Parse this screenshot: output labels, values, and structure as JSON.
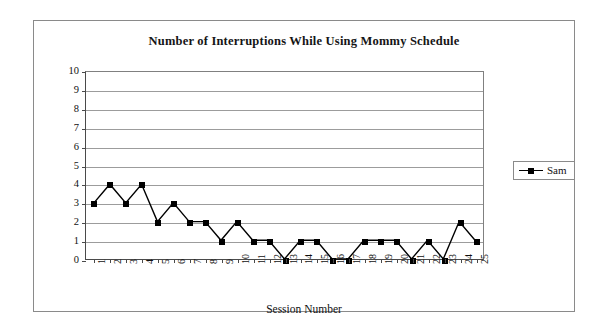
{
  "chart_data": {
    "type": "line",
    "title": "Number of Interruptions While Using Mommy Schedule",
    "xlabel": "Session Number",
    "ylabel": "",
    "x": [
      1,
      2,
      3,
      4,
      5,
      6,
      7,
      8,
      9,
      10,
      11,
      12,
      13,
      14,
      15,
      16,
      17,
      18,
      19,
      20,
      21,
      22,
      23,
      24,
      25
    ],
    "xticklabels": [
      "1",
      "2",
      "3",
      "4",
      "5",
      "6",
      "7",
      "8",
      "9",
      "10",
      "11",
      "12",
      "13",
      "14",
      "15",
      "16",
      "17",
      "18",
      "19",
      "20",
      "21",
      "22",
      "23",
      "24",
      "25"
    ],
    "yticklabels": [
      "0",
      "1",
      "2",
      "3",
      "4",
      "5",
      "6",
      "7",
      "8",
      "9",
      "10"
    ],
    "ylim": [
      0,
      10
    ],
    "yticks": [
      0,
      1,
      2,
      3,
      4,
      5,
      6,
      7,
      8,
      9,
      10
    ],
    "grid": "horizontal",
    "legend_position": "right",
    "series": [
      {
        "name": "Sam",
        "color": "#000000",
        "marker": "filled-square",
        "values": [
          3,
          4,
          3,
          4,
          2,
          3,
          2,
          2,
          1,
          2,
          1,
          1,
          0,
          1,
          1,
          0,
          0,
          1,
          1,
          1,
          0,
          1,
          0,
          2,
          1
        ]
      }
    ]
  },
  "legend": {
    "entries": [
      {
        "label": "Sam"
      }
    ]
  }
}
